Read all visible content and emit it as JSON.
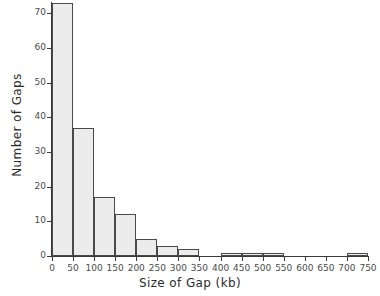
{
  "chart_data": {
    "type": "bar",
    "title": "",
    "xlabel": "Size of Gap (kb)",
    "ylabel": "Number of Gaps",
    "bin_width": 50,
    "xlim": [
      0,
      750
    ],
    "ylim": [
      0,
      75
    ],
    "grid": false,
    "legend": null,
    "xticks": [
      0,
      50,
      100,
      150,
      200,
      250,
      300,
      350,
      400,
      450,
      500,
      550,
      600,
      650,
      700,
      750
    ],
    "xtick_labels": [
      "0",
      "50",
      "100",
      "150",
      "200",
      "250",
      "300",
      "350",
      "400",
      "450",
      "500",
      "550",
      "600",
      "650",
      "700",
      "750"
    ],
    "yticks": [
      0,
      10,
      20,
      30,
      40,
      50,
      60,
      70
    ],
    "ytick_labels": [
      "0",
      "10",
      "20",
      "30",
      "40",
      "50",
      "60",
      "70"
    ],
    "bin_edges": [
      0,
      50,
      100,
      150,
      200,
      250,
      300,
      350,
      400,
      450,
      500,
      550,
      600,
      650,
      700,
      750
    ],
    "categories": [
      "0-50",
      "50-100",
      "100-150",
      "150-200",
      "200-250",
      "250-300",
      "300-350",
      "350-400",
      "400-450",
      "450-500",
      "500-550",
      "550-600",
      "600-650",
      "650-700",
      "700-750"
    ],
    "values": [
      73,
      37,
      17,
      12,
      5,
      3,
      2,
      0,
      1,
      1,
      1,
      0,
      0,
      0,
      1
    ],
    "bar_fill_color": "#ececec",
    "bar_edge_color": "#4a4a4a",
    "axis_color": "#3a3a3a",
    "background_color": "#ffffff"
  }
}
